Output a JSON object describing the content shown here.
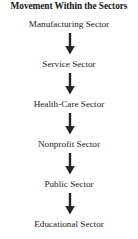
{
  "diagram": {
    "title": "Movement Within the Sectors",
    "type": "vertical-flowchart",
    "orientation": "top-to-bottom",
    "arrow_icon": "down-arrow-icon",
    "arrow_color": "#262626",
    "text_color": "#232323",
    "background_color": "#ffffff",
    "node_count": 6,
    "arrow_count": 5,
    "nodes": [
      {
        "label": "Manufacturing Sector"
      },
      {
        "label": "Service Sector"
      },
      {
        "label": "Health-Care Sector"
      },
      {
        "label": "Nonprofit Sector"
      },
      {
        "label": "Public Sector"
      },
      {
        "label": "Educational Sector"
      }
    ]
  }
}
